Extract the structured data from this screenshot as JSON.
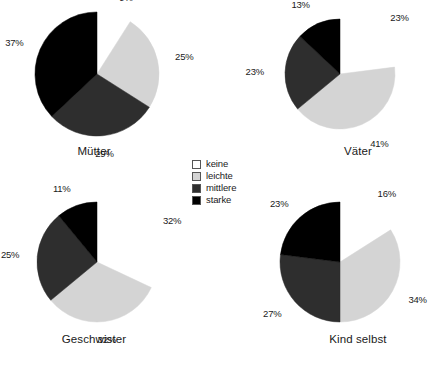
{
  "chart_data": {
    "type": "pie",
    "title": "",
    "legend_position": "center",
    "legend": [
      {
        "label": "keine",
        "color": "#ffffff"
      },
      {
        "label": "leichte",
        "color": "#d4d4d4"
      },
      {
        "label": "mittlere",
        "color": "#2e2e2e"
      },
      {
        "label": "starke",
        "color": "#000000"
      }
    ],
    "categories": [
      "keine",
      "leichte",
      "mittlere",
      "starke"
    ],
    "colors": [
      "#ffffff",
      "#d4d4d4",
      "#2e2e2e",
      "#000000"
    ],
    "panels": [
      {
        "name": "muetter",
        "title": "Mütter",
        "values": [
          9,
          25,
          29,
          37
        ],
        "labels": [
          "9%",
          "25%",
          "29%",
          "37%"
        ]
      },
      {
        "name": "vaeter",
        "title": "Väter",
        "values": [
          23,
          41,
          23,
          13
        ],
        "labels": [
          "23%",
          "41%",
          "23%",
          "13%"
        ]
      },
      {
        "name": "geschwister",
        "title": "Geschwister",
        "values": [
          32,
          32,
          25,
          11
        ],
        "labels": [
          "32%",
          "32%",
          "25%",
          "11%"
        ]
      },
      {
        "name": "kind-selbst",
        "title": "Kind selbst",
        "values": [
          16,
          34,
          27,
          23
        ],
        "labels": [
          "16%",
          "34%",
          "27%",
          "23%"
        ]
      }
    ]
  }
}
